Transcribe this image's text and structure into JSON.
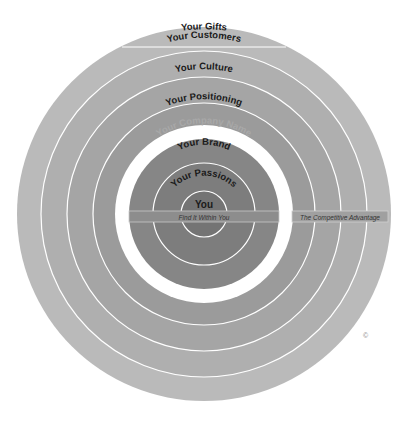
{
  "diagram": {
    "rings": [
      {
        "label": "Your Gifts",
        "color": "#b9b9b9"
      },
      {
        "label": "Your Customers",
        "color": "#aeaeae"
      },
      {
        "label": "Your Culture",
        "color": "#a5a5a5"
      },
      {
        "label": "Your Positioning",
        "color": "#9a9a9a"
      },
      {
        "label": "Your Company Name",
        "color": "#ffffff"
      },
      {
        "label": "Your Brand",
        "color": "#858585"
      },
      {
        "label": "Your Passions",
        "color": "#7b7b7b"
      },
      {
        "label": "You",
        "color": "#727272"
      }
    ],
    "band_inner_label": "Find It Within You",
    "band_outer_label": "The Competitive Advantage",
    "copyright_symbol": "©",
    "divider_color": "#ffffff",
    "band_color": "#8e8e8e"
  }
}
